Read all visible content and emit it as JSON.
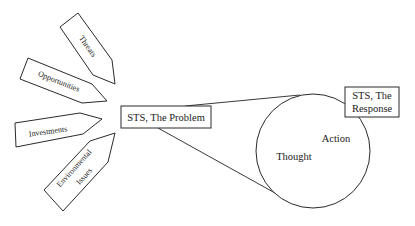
{
  "diagram": {
    "inputs": [
      {
        "id": "threats",
        "label": "Threats"
      },
      {
        "id": "opportunities",
        "label": "Opportunities"
      },
      {
        "id": "investments",
        "label": "Investments"
      },
      {
        "id": "environmental-issues",
        "label_line1": "Environmental",
        "label_line2": "Issues"
      }
    ],
    "problem_box": {
      "label": "STS, The Problem"
    },
    "response_box": {
      "label_line1": "STS, The",
      "label_line2": "Response"
    },
    "cycle": {
      "label_thought": "Thought",
      "label_action": "Action"
    }
  }
}
